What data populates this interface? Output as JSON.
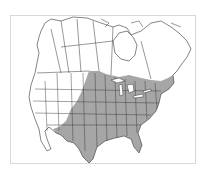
{
  "map": {
    "title": "Range map of North America",
    "region": "North America",
    "colors": {
      "background": "#ffffff",
      "range_fill": "#a6a6a6",
      "boundary_stroke": "#333333",
      "frame": "#d8d8d8"
    },
    "legend": []
  }
}
